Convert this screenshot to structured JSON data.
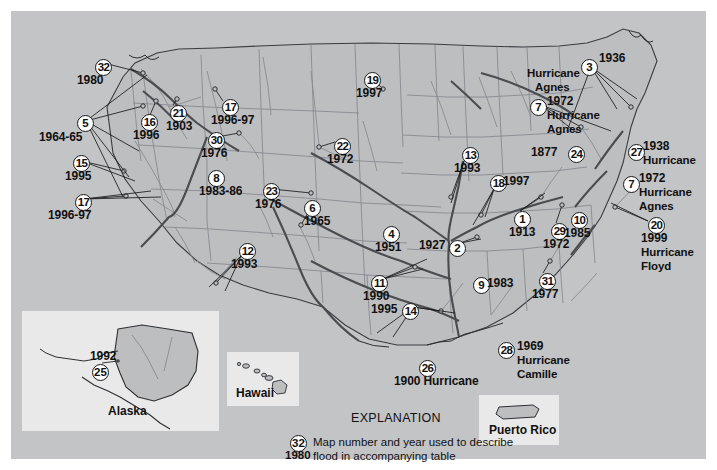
{
  "figure": {
    "kind": "reference-map",
    "background_color": "#c3c4c6",
    "page_color": "#ffffff",
    "land_color": "#bdbec0",
    "river_color": "#8d8f93",
    "major_river_color": "#4a4c50",
    "boundary_color": "#6e7074",
    "label_color": "#111111",
    "marker_fill": "#fdfdfd",
    "marker_stroke": "#1a1a1a"
  },
  "explanation": {
    "title": "EXPLANATION",
    "sample_number": "32",
    "sample_year": "1980",
    "line1": "Map number and year used to describe",
    "line2": "flood in accompanying table"
  },
  "insets": [
    {
      "name": "alaska",
      "caption": "Alaska",
      "number": "25",
      "year": "1992"
    },
    {
      "name": "hawaii",
      "caption": "Hawaii"
    },
    {
      "name": "puerto-rico",
      "caption": "Puerto Rico"
    }
  ],
  "markers": [
    {
      "id": "m32",
      "number": "32",
      "year": "1980",
      "note": "",
      "x": 84,
      "y": 48,
      "yx": 66,
      "yy": 64,
      "leader": [
        [
          93,
          52
        ],
        [
          132,
          62
        ]
      ]
    },
    {
      "id": "m5",
      "number": "5",
      "year": "1964-65",
      "note": "",
      "x": 66,
      "y": 104,
      "yx": 28,
      "yy": 121,
      "leader": [
        [
          75,
          110
        ],
        [
          132,
          95
        ]
      ]
    },
    {
      "id": "m16",
      "number": "16",
      "year": "1996",
      "note": "",
      "x": 130,
      "y": 103,
      "yx": 122,
      "yy": 119,
      "leader": [
        [
          139,
          104
        ],
        [
          145,
          90
        ]
      ]
    },
    {
      "id": "m21",
      "number": "21",
      "year": "1903",
      "note": "",
      "x": 159,
      "y": 94,
      "yx": 155,
      "yy": 110,
      "leader": [
        [
          162,
          94
        ],
        [
          166,
          88
        ]
      ]
    },
    {
      "id": "m17a",
      "number": "17",
      "year": "1996-97",
      "note": "",
      "x": 211,
      "y": 88,
      "yx": 200,
      "yy": 104,
      "leader": [
        [
          212,
          90
        ],
        [
          204,
          78
        ]
      ]
    },
    {
      "id": "m30",
      "number": "30",
      "year": "1976",
      "note": "",
      "x": 197,
      "y": 121,
      "yx": 190,
      "yy": 137,
      "leader": [
        [
          206,
          126
        ],
        [
          228,
          122
        ]
      ]
    },
    {
      "id": "m15",
      "number": "15",
      "year": "1995",
      "note": "",
      "x": 62,
      "y": 144,
      "yx": 54,
      "yy": 160,
      "leader": [
        [
          71,
          150
        ],
        [
          113,
          160
        ]
      ]
    },
    {
      "id": "m17b",
      "number": "17",
      "year": "1996-97",
      "note": "",
      "x": 64,
      "y": 183,
      "yx": 37,
      "yy": 199,
      "leader": [
        [
          73,
          188
        ],
        [
          115,
          185
        ]
      ]
    },
    {
      "id": "m8",
      "number": "8",
      "year": "1983-86",
      "note": "",
      "x": 197,
      "y": 159,
      "yx": 188,
      "yy": 175,
      "leader": []
    },
    {
      "id": "m23",
      "number": "23",
      "year": "1976",
      "note": "",
      "x": 252,
      "y": 172,
      "yx": 244,
      "yy": 188,
      "leader": [
        [
          261,
          178
        ],
        [
          300,
          182
        ]
      ]
    },
    {
      "id": "m6",
      "number": "6",
      "year": "1965",
      "note": "",
      "x": 293,
      "y": 189,
      "yx": 293,
      "yy": 205,
      "leader": [
        [
          298,
          200
        ],
        [
          290,
          214
        ]
      ]
    },
    {
      "id": "m12",
      "number": "12",
      "year": "1993",
      "note": "",
      "x": 228,
      "y": 232,
      "yx": 220,
      "yy": 248,
      "leader": [
        [
          230,
          245
        ],
        [
          205,
          272
        ]
      ]
    },
    {
      "id": "m19",
      "number": "19",
      "year": "1997",
      "note": "",
      "x": 353,
      "y": 61,
      "yx": 345,
      "yy": 77,
      "leader": [
        [
          360,
          66
        ],
        [
          372,
          78
        ]
      ]
    },
    {
      "id": "m22",
      "number": "22",
      "year": "1972",
      "note": "",
      "x": 323,
      "y": 127,
      "yx": 316,
      "yy": 143,
      "leader": [
        [
          324,
          131
        ],
        [
          308,
          136
        ]
      ]
    },
    {
      "id": "m13",
      "number": "13",
      "year": "1993",
      "note": "",
      "x": 451,
      "y": 136,
      "yx": 443,
      "yy": 152,
      "leader": [
        [
          453,
          150
        ],
        [
          440,
          186
        ]
      ]
    },
    {
      "id": "m18",
      "number": "18",
      "year": "1997",
      "note": "",
      "x": 479,
      "y": 164,
      "yx": 492,
      "yy": 165,
      "leader": [
        [
          483,
          178
        ],
        [
          470,
          204
        ]
      ]
    },
    {
      "id": "m4",
      "number": "4",
      "year": "1951",
      "note": "",
      "x": 372,
      "y": 215,
      "yx": 364,
      "yy": 231,
      "leader": []
    },
    {
      "id": "m2",
      "number": "2",
      "year": "1927",
      "note": "",
      "x": 438,
      "y": 229,
      "yx": 408,
      "yy": 229,
      "leader": [
        [
          449,
          232
        ],
        [
          466,
          226
        ]
      ]
    },
    {
      "id": "m1",
      "number": "1",
      "year": "1913",
      "note": "",
      "x": 503,
      "y": 200,
      "yx": 498,
      "yy": 216,
      "leader": [
        [
          509,
          200
        ],
        [
          530,
          186
        ]
      ]
    },
    {
      "id": "m11",
      "number": "11",
      "year": "1990",
      "note": "",
      "x": 360,
      "y": 264,
      "yx": 352,
      "yy": 280,
      "leader": [
        [
          372,
          268
        ],
        [
          404,
          256
        ]
      ]
    },
    {
      "id": "m14",
      "number": "14",
      "year": "1995",
      "note": "",
      "x": 391,
      "y": 292,
      "yx": 360,
      "yy": 293,
      "leader": [
        [
          402,
          296
        ],
        [
          430,
          300
        ]
      ]
    },
    {
      "id": "m9",
      "number": "9",
      "year": "1983",
      "note": "",
      "x": 462,
      "y": 266,
      "yx": 476,
      "yy": 267,
      "leader": []
    },
    {
      "id": "m31",
      "number": "31",
      "year": "1977",
      "note": "",
      "x": 528,
      "y": 262,
      "yx": 521,
      "yy": 278,
      "leader": [
        [
          532,
          262
        ],
        [
          539,
          250
        ]
      ]
    },
    {
      "id": "m29",
      "number": "29",
      "year": "1972",
      "note": "",
      "x": 540,
      "y": 212,
      "yx": 532,
      "yy": 228,
      "leader": [
        [
          545,
          212
        ],
        [
          551,
          194
        ]
      ]
    },
    {
      "id": "m10",
      "number": "10",
      "year": "1985",
      "note": "",
      "x": 560,
      "y": 201,
      "yx": 553,
      "yy": 217,
      "leader": []
    },
    {
      "id": "m3",
      "number": "3",
      "year": "1936",
      "note": "",
      "x": 570,
      "y": 48,
      "yx": 588,
      "yy": 42,
      "leader": [
        [
          580,
          56
        ],
        [
          620,
          96
        ]
      ]
    },
    {
      "id": "m7a",
      "number": "7",
      "year": "1972",
      "note": "Hurricane\nAgnes",
      "x": 519,
      "y": 88,
      "yx": 536,
      "yy": 85,
      "leader": [
        [
          530,
          94
        ],
        [
          570,
          116
        ]
      ]
    },
    {
      "id": "m24",
      "number": "24",
      "year": "1877",
      "note": "",
      "x": 557,
      "y": 135,
      "yx": 520,
      "yy": 136,
      "leader": []
    },
    {
      "id": "m27",
      "number": "27",
      "year": "1938",
      "note": "Hurricane",
      "x": 617,
      "y": 133,
      "yx": 632,
      "yy": 130,
      "leader": []
    },
    {
      "id": "m7b",
      "number": "7",
      "year": "1972",
      "note": "Hurricane\nAgnes",
      "x": 612,
      "y": 165,
      "yx": 628,
      "yy": 162,
      "leader": []
    },
    {
      "id": "m20",
      "number": "20",
      "year": "1999",
      "note": "Hurricane\nFloyd",
      "x": 637,
      "y": 206,
      "yx": 630,
      "yy": 222,
      "leader": [
        [
          637,
          210
        ],
        [
          604,
          196
        ]
      ]
    },
    {
      "id": "m28",
      "number": "28",
      "year": "1969",
      "note": "Hurricane\nCamille",
      "x": 487,
      "y": 331,
      "yx": 506,
      "yy": 330,
      "leader": []
    },
    {
      "id": "m26",
      "number": "26",
      "year": "1900 Hurricane",
      "note": "",
      "x": 408,
      "y": 349,
      "yx": 383,
      "yy": 365,
      "leader": []
    }
  ],
  "static_labels": {
    "hurricane_agnes_top_line1": "Hurricane",
    "hurricane_agnes_top_line2": "Agnes",
    "m27_note": "Hurricane",
    "m7b_note1": "Hurricane",
    "m7b_note2": "Agnes",
    "m20_note1": "Hurricane",
    "m20_note2": "Floyd",
    "m28_note1": "Hurricane",
    "m28_note2": "Camille",
    "m26_text": "1900 Hurricane"
  }
}
